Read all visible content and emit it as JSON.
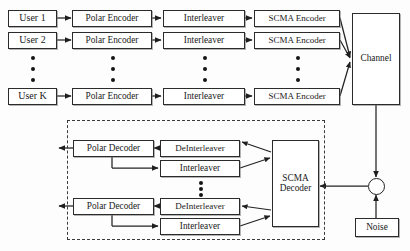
{
  "figure": {
    "line_color": "#2b2b2b",
    "dash_color": "#3a3a3a",
    "background": "#fdfdfd"
  },
  "transmitter": {
    "users": [
      {
        "label": "User 1"
      },
      {
        "label": "User 2"
      },
      {
        "label": "User K"
      }
    ],
    "encoder_label": "Polar Encoder",
    "interleaver_label": "Interleaver",
    "scma_encoder_label": "SCMA Encoder",
    "rows": [
      {
        "user": "User 1",
        "polar_encoder": "Polar Encoder",
        "interleaver": "Interleaver",
        "scma_encoder": "SCMA Encoder"
      },
      {
        "user": "User 2",
        "polar_encoder": "Polar Encoder",
        "interleaver": "Interleaver",
        "scma_encoder": "SCMA Encoder"
      },
      {
        "user": "User K",
        "polar_encoder": "Polar Encoder",
        "interleaver": "Interleaver",
        "scma_encoder": "SCMA Encoder"
      }
    ],
    "ellipsis": "vertical-dots"
  },
  "channel": {
    "label": "Channel"
  },
  "noise": {
    "label": "Noise",
    "adder": "plus-summing-junction"
  },
  "receiver": {
    "scma_decoder_line1": "SCMA",
    "scma_decoder_line2": "Decoder",
    "rows": [
      {
        "polar_decoder": "Polar Decoder",
        "deinterleaver": "DeInterleaver",
        "interleaver": "Interleaver"
      },
      {
        "polar_decoder": "Polar Decoder",
        "deinterleaver": "DeInterleaver",
        "interleaver": "Interleaver"
      }
    ],
    "ellipsis": "vertical-dots",
    "dashed_region": "iterative-receiver-boundary"
  }
}
